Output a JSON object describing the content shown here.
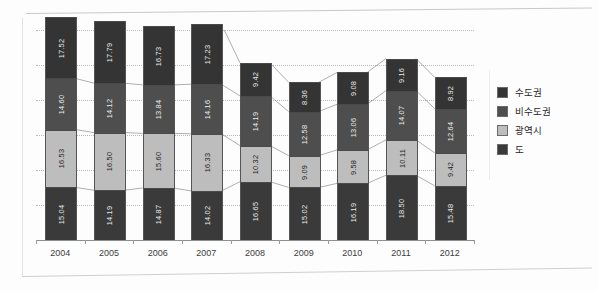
{
  "chart_data": {
    "type": "bar",
    "subtype": "stacked-bar",
    "title": "",
    "xlabel": "",
    "ylabel": "",
    "grid": true,
    "legend_position": "right",
    "ylim": [
      0,
      60
    ],
    "categories": [
      "2004",
      "2005",
      "2006",
      "2007",
      "2008",
      "2009",
      "2010",
      "2011",
      "2012"
    ],
    "series": [
      {
        "name": "도",
        "color": "#3a3a3a",
        "values": [
          15.04,
          14.19,
          14.87,
          14.02,
          16.65,
          15.02,
          16.19,
          18.5,
          15.48
        ]
      },
      {
        "name": "광역시",
        "color": "#bdbdbd",
        "values": [
          16.53,
          16.5,
          15.6,
          16.33,
          10.32,
          9.09,
          9.58,
          10.11,
          9.42
        ]
      },
      {
        "name": "비수도권",
        "color": "#4e4e4e",
        "values": [
          14.6,
          14.12,
          13.84,
          14.16,
          14.19,
          12.58,
          13.06,
          14.07,
          12.64
        ]
      },
      {
        "name": "수도권",
        "color": "#343434",
        "values": [
          17.52,
          17.79,
          16.73,
          17.23,
          9.42,
          8.36,
          9.08,
          9.16,
          8.92
        ]
      }
    ]
  },
  "legend": {
    "items": [
      {
        "label": "수도권",
        "color": "#343434"
      },
      {
        "label": "비수도권",
        "color": "#4e4e4e"
      },
      {
        "label": "광역시",
        "color": "#bdbdbd"
      },
      {
        "label": "도",
        "color": "#3a3a3a"
      }
    ]
  },
  "axis": {
    "x_ticks": [
      "2004",
      "2005",
      "2006",
      "2007",
      "2008",
      "2009",
      "2010",
      "2011",
      "2012"
    ]
  }
}
